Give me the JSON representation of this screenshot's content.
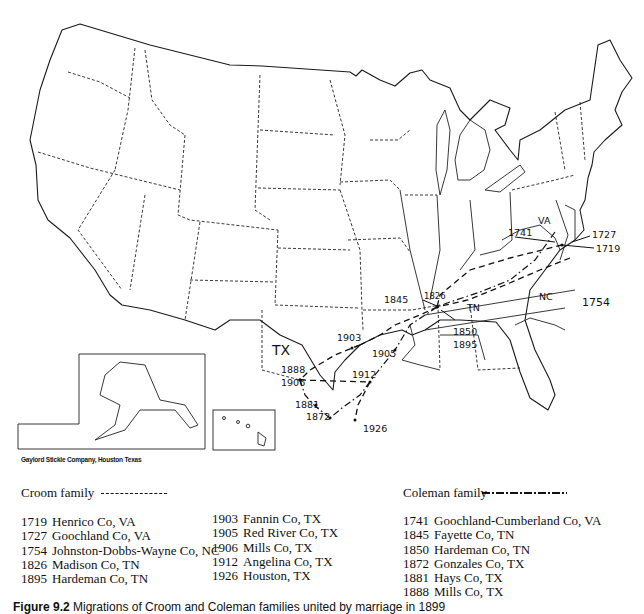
{
  "map": {
    "state_labels": [
      "TX",
      "TN",
      "VA",
      "NC"
    ],
    "croom_points": [
      {
        "year": "1719",
        "place": "Henrico Co, VA"
      },
      {
        "year": "1727",
        "place": "Goochland Co, VA"
      },
      {
        "year": "1754",
        "place": "Johnston-Dobbs-Wayne Co, NC"
      },
      {
        "year": "1826",
        "place": "Madison Co, TN"
      },
      {
        "year": "1895",
        "place": "Hardeman Co, TN"
      },
      {
        "year": "1903",
        "place": "Fannin Co, TX"
      },
      {
        "year": "1905",
        "place": "Red River Co, TX"
      },
      {
        "year": "1906",
        "place": "Mills Co, TX"
      },
      {
        "year": "1912",
        "place": "Angelina Co, TX"
      },
      {
        "year": "1926",
        "place": "Houston, TX"
      }
    ],
    "coleman_points": [
      {
        "year": "1741",
        "place": "Goochland-Cumberland Co, VA"
      },
      {
        "year": "1845",
        "place": "Fayette Co, TN"
      },
      {
        "year": "1850",
        "place": "Hardeman Co, TN"
      },
      {
        "year": "1872",
        "place": "Gonzales Co, TX"
      },
      {
        "year": "1881",
        "place": "Hays Co, TX"
      },
      {
        "year": "1888",
        "place": "Mills Co, TX"
      }
    ],
    "annotations": {
      "l1727": "1727",
      "l1719": "1719",
      "l1741": "1741",
      "l1754": "1754",
      "l1826": "1826",
      "l1845": "1845",
      "l1850": "1850",
      "l1895": "1895",
      "l1903": "1903",
      "l1905": "1905",
      "l1888": "1888",
      "l1906": "1906",
      "l1912": "1912",
      "l1881": "1881",
      "l1872": "1872",
      "l1926": "1926",
      "tx": "TX",
      "tn": "TN",
      "va": "VA",
      "nc": "NC"
    },
    "credit": "Gaylord Stickle Company, Houston Texas"
  },
  "legend": {
    "croom": {
      "title": "Croom family",
      "line_style": "dashed",
      "col1": [
        {
          "year": "1719",
          "place": "Henrico Co, VA"
        },
        {
          "year": "1727",
          "place": "Goochland Co, VA"
        },
        {
          "year": "1754",
          "place": "Johnston-Dobbs-Wayne Co, NC"
        },
        {
          "year": "1826",
          "place": "Madison Co, TN"
        },
        {
          "year": "1895",
          "place": "Hardeman Co, TN"
        }
      ],
      "col2": [
        {
          "year": "1903",
          "place": "Fannin Co, TX"
        },
        {
          "year": "1905",
          "place": "Red River Co, TX"
        },
        {
          "year": "1906",
          "place": "Mills Co, TX"
        },
        {
          "year": "1912",
          "place": "Angelina Co, TX"
        },
        {
          "year": "1926",
          "place": "Houston, TX"
        }
      ]
    },
    "coleman": {
      "title": "Coleman family",
      "line_style": "dash-dot",
      "entries": [
        {
          "year": "1741",
          "place": "Goochland-Cumberland Co, VA"
        },
        {
          "year": "1845",
          "place": "Fayette Co, TN"
        },
        {
          "year": "1850",
          "place": "Hardeman Co, TN"
        },
        {
          "year": "1872",
          "place": "Gonzales Co, TX"
        },
        {
          "year": "1881",
          "place": "Hays Co, TX"
        },
        {
          "year": "1888",
          "place": "Mills Co, TX"
        }
      ]
    }
  },
  "caption": {
    "label": "Figure 9.2",
    "text": "Migrations of Croom and Coleman families united by marriage in 1899"
  }
}
